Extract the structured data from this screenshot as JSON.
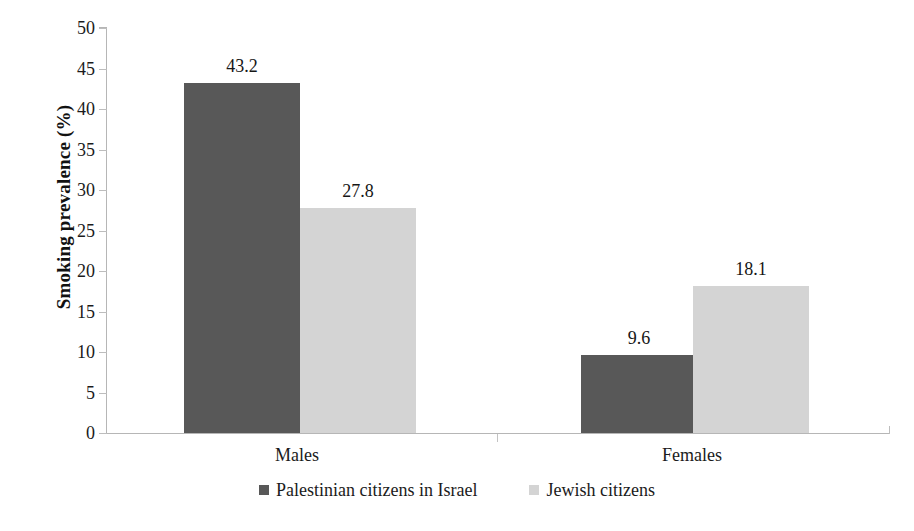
{
  "chart_data": {
    "type": "bar",
    "title": "",
    "xlabel": "",
    "ylabel": "Smoking prevalence (%)",
    "categories": [
      "Males",
      "Females"
    ],
    "series": [
      {
        "name": "Palestinian citizens in Israel",
        "color": "#585858",
        "values": [
          43.2,
          9.6
        ],
        "labels": [
          "43.2",
          "9.6"
        ]
      },
      {
        "name": "Jewish citizens",
        "color": "#d4d4d4",
        "values": [
          27.8,
          18.1
        ],
        "labels": [
          "27.8",
          "18.1"
        ]
      }
    ],
    "ylim": [
      0,
      50
    ],
    "ytick_step": 5,
    "yticks": [
      0,
      5,
      10,
      15,
      20,
      25,
      30,
      35,
      40,
      45,
      50
    ],
    "ytick_labels": [
      "0",
      "5",
      "10",
      "15",
      "20",
      "25",
      "30",
      "35",
      "40",
      "45",
      "50"
    ],
    "grid": false,
    "legend_position": "bottom",
    "data_labels_shown": true
  },
  "axis": {
    "y_title": "Smoking prevalence (%)"
  },
  "legend": {
    "items": [
      {
        "label": "Palestinian citizens in Israel",
        "color": "#585858"
      },
      {
        "label": "Jewish citizens",
        "color": "#d4d4d4"
      }
    ]
  },
  "colors": {
    "series_dark": "#585858",
    "series_light": "#d4d4d4",
    "axis": "#b6b6b6",
    "text": "#1b1b1b",
    "background": "#ffffff"
  }
}
